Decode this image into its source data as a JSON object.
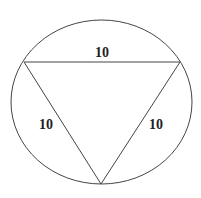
{
  "figure": {
    "shapes": {
      "circle": {
        "cx": 101.5,
        "cy": 102,
        "rx": 90.5,
        "ry": 82,
        "stroke": "#444444"
      },
      "triangle": {
        "vertices": [
          [
            24,
            62
          ],
          [
            180,
            62
          ],
          [
            101,
            184
          ]
        ],
        "stroke": "#444444",
        "type": "equilateral inscribed"
      }
    },
    "labels": {
      "top_side": "10",
      "left_side": "10",
      "right_side": "10"
    }
  }
}
